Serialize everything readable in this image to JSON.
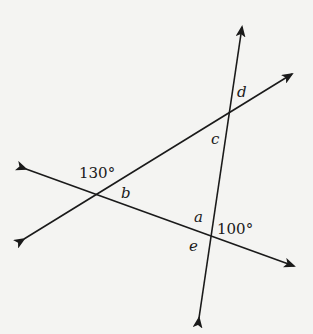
{
  "diagram": {
    "lines": [
      {
        "name": "steep-line",
        "from": [
          198,
          320
        ],
        "to": [
          243,
          25
        ]
      },
      {
        "name": "rising-line",
        "from": [
          22,
          240
        ],
        "to": [
          294,
          73
        ]
      },
      {
        "name": "falling-line",
        "from": [
          24,
          168
        ],
        "to": [
          296,
          267
        ]
      }
    ],
    "labels": {
      "angle_130": "130°",
      "angle_100": "100°",
      "a": "a",
      "b": "b",
      "c": "c",
      "d": "d",
      "e": "e"
    },
    "colors": {
      "line": "#1a1a1a",
      "background": "#f4f4f2"
    }
  }
}
